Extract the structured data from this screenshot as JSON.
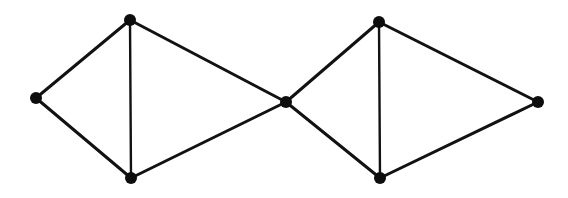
{
  "figure": {
    "kind": "graph-diagram",
    "canvas": {
      "width": 568,
      "height": 198
    },
    "background_color": "#ffffff",
    "vertex_color": "#0d0d0d",
    "edge_color": "#121212",
    "vertex_radius": 6,
    "edge_width_default": 3,
    "edge_width_thin": 2.4
  },
  "chart_data": {
    "type": "diagram",
    "graph_type": "undirected",
    "vertex_count": 7,
    "edge_count": 10,
    "title": "",
    "vertices": [
      {
        "id": "v1",
        "label": "left-apex",
        "x": 36,
        "y": 98,
        "degree": 2
      },
      {
        "id": "v2",
        "label": "upper-left",
        "x": 130,
        "y": 20,
        "degree": 3
      },
      {
        "id": "v3",
        "label": "lower-left",
        "x": 131,
        "y": 178,
        "degree": 3
      },
      {
        "id": "v4",
        "label": "center-cut",
        "x": 286,
        "y": 102,
        "degree": 4
      },
      {
        "id": "v5",
        "label": "upper-right",
        "x": 379,
        "y": 22,
        "degree": 3
      },
      {
        "id": "v6",
        "label": "lower-right",
        "x": 380,
        "y": 178,
        "degree": 3
      },
      {
        "id": "v7",
        "label": "right-apex",
        "x": 538,
        "y": 102,
        "degree": 2
      }
    ],
    "edges": [
      {
        "id": "e1",
        "from": "v1",
        "to": "v2",
        "width": 3
      },
      {
        "id": "e2",
        "from": "v1",
        "to": "v3",
        "width": 3
      },
      {
        "id": "e3",
        "from": "v2",
        "to": "v3",
        "width": 2.4
      },
      {
        "id": "e4",
        "from": "v2",
        "to": "v4",
        "width": 3
      },
      {
        "id": "e5",
        "from": "v3",
        "to": "v4",
        "width": 3
      },
      {
        "id": "e6",
        "from": "v4",
        "to": "v5",
        "width": 3
      },
      {
        "id": "e7",
        "from": "v4",
        "to": "v6",
        "width": 3
      },
      {
        "id": "e8",
        "from": "v5",
        "to": "v6",
        "width": 2.4
      },
      {
        "id": "e9",
        "from": "v5",
        "to": "v7",
        "width": 3
      },
      {
        "id": "e10",
        "from": "v6",
        "to": "v7",
        "width": 3
      }
    ],
    "annotations": [],
    "legend": [],
    "grid": false
  }
}
